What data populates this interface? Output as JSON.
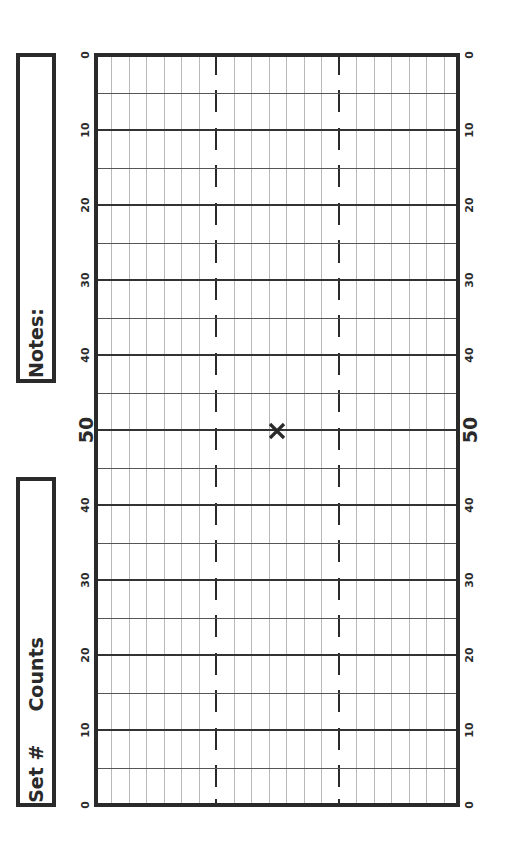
{
  "notes_box": {
    "label": "Notes:"
  },
  "set_box": {
    "label": "Set #     Counts"
  },
  "field": {
    "yard_labels": [
      "0",
      "10",
      "20",
      "30",
      "40",
      "50",
      "40",
      "30",
      "20",
      "10",
      "0"
    ],
    "center_marker": "x-mark",
    "line_color": "#2a2a2a",
    "grid_color": "#b8b8b8"
  }
}
